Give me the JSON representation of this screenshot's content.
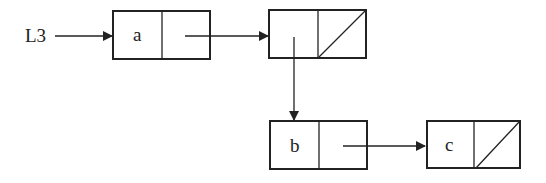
{
  "diagram": {
    "type": "linked-list",
    "pointer_label": "L3",
    "nodes": [
      {
        "id": "n1",
        "car": "a",
        "cdr": "pointer-to-n2"
      },
      {
        "id": "n2",
        "car": "pointer-to-n3",
        "cdr": "null"
      },
      {
        "id": "n3",
        "car": "b",
        "cdr": "pointer-to-n4"
      },
      {
        "id": "n4",
        "car": "c",
        "cdr": "null"
      }
    ],
    "colors": {
      "stroke": "#222222",
      "background": "#ffffff"
    }
  }
}
